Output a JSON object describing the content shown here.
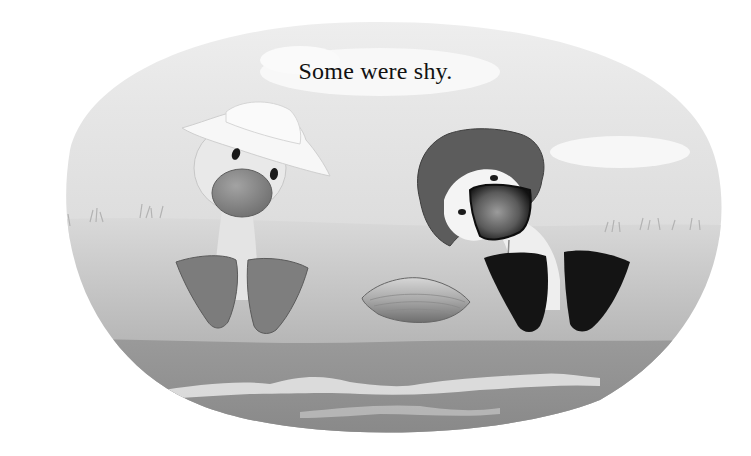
{
  "page": {
    "caption": "Some were shy."
  },
  "illustration": {
    "style": "grayscale painted storybook illustration",
    "characters": [
      {
        "name": "left-duckling",
        "hat": "white sun hat",
        "feet": "gray webbed feet"
      },
      {
        "name": "right-duckling",
        "hat": "dark gray floppy hat",
        "feet": "black webbed feet",
        "pose": "head tilted, bill covering face"
      }
    ],
    "objects": [
      "clam-shell",
      "grass-tufts",
      "clouds",
      "water-waves"
    ],
    "colors": {
      "background": "#ffffff",
      "sky": "#eeeeee",
      "ground": "#b9b9b9",
      "water": "#8e8e8e",
      "dark_feet": "#141414",
      "gray_feet": "#7d7d7d",
      "dark_hat": "#5a5a5a"
    }
  }
}
